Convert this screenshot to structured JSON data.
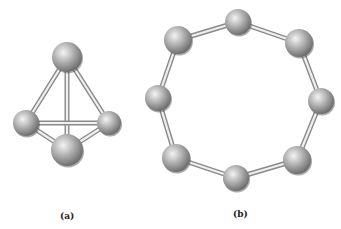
{
  "figure": {
    "panels": [
      {
        "id": "a",
        "label": "(a)",
        "label_pos": [
          60,
          211
        ],
        "structure": "tetrahedron",
        "atoms": [
          {
            "x": 67,
            "y": 57,
            "r": 15
          },
          {
            "x": 26,
            "y": 123,
            "r": 13
          },
          {
            "x": 109,
            "y": 123,
            "r": 12
          },
          {
            "x": 67,
            "y": 150,
            "r": 16
          }
        ],
        "bonds": [
          [
            0,
            1
          ],
          [
            0,
            2
          ],
          [
            0,
            3
          ],
          [
            1,
            2
          ],
          [
            1,
            3
          ],
          [
            2,
            3
          ]
        ]
      },
      {
        "id": "b",
        "label": "(b)",
        "label_pos": [
          233,
          209
        ],
        "structure": "ring-8",
        "atoms": [
          {
            "x": 178,
            "y": 40,
            "r": 14
          },
          {
            "x": 238,
            "y": 22,
            "r": 13
          },
          {
            "x": 299,
            "y": 43,
            "r": 14
          },
          {
            "x": 321,
            "y": 101,
            "r": 13
          },
          {
            "x": 297,
            "y": 160,
            "r": 14
          },
          {
            "x": 236,
            "y": 178,
            "r": 13
          },
          {
            "x": 176,
            "y": 158,
            "r": 14
          },
          {
            "x": 158,
            "y": 98,
            "r": 13
          }
        ],
        "bonds": [
          [
            0,
            1
          ],
          [
            1,
            2
          ],
          [
            2,
            3
          ],
          [
            3,
            4
          ],
          [
            4,
            5
          ],
          [
            5,
            6
          ],
          [
            6,
            7
          ],
          [
            7,
            0
          ]
        ]
      }
    ],
    "colors": {
      "atom_light": "#e6e6e6",
      "atom_mid": "#a8a8a8",
      "atom_dark": "#6a6a6a",
      "bond_light": "#f0f0f0",
      "bond_dark": "#8a8a8a"
    }
  }
}
